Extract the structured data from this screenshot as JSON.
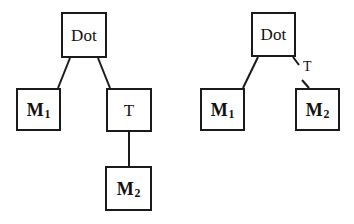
{
  "diagram": {
    "type": "tree-pair",
    "background_color": "#ffffff",
    "line_color": "#1a1a1a",
    "text_color": "#111111",
    "left_tree": {
      "name": "left-tree",
      "nodes": [
        {
          "id": "dot",
          "label": "Dot",
          "base": "Dot",
          "sub": "",
          "x": 61,
          "y": 12,
          "w": 46,
          "h": 46
        },
        {
          "id": "m1",
          "label": "M1",
          "base": "M",
          "sub": "1",
          "x": 16,
          "y": 88,
          "w": 45,
          "h": 43
        },
        {
          "id": "t",
          "label": "T",
          "base": "T",
          "sub": "",
          "x": 106,
          "y": 88,
          "w": 46,
          "h": 44
        },
        {
          "id": "m2",
          "label": "M2",
          "base": "M",
          "sub": "2",
          "x": 105,
          "y": 166,
          "w": 47,
          "h": 45
        }
      ],
      "edges": [
        {
          "from": "dot",
          "to": "m1",
          "label": "",
          "style": "solid"
        },
        {
          "from": "dot",
          "to": "t",
          "label": "",
          "style": "solid"
        },
        {
          "from": "t",
          "to": "m2",
          "label": "",
          "style": "solid"
        }
      ]
    },
    "right_tree": {
      "name": "right-tree",
      "nodes": [
        {
          "id": "dot",
          "label": "Dot",
          "base": "Dot",
          "sub": "",
          "x": 251,
          "y": 12,
          "w": 45,
          "h": 45
        },
        {
          "id": "m1",
          "label": "M1",
          "base": "M",
          "sub": "1",
          "x": 200,
          "y": 88,
          "w": 45,
          "h": 43
        },
        {
          "id": "m2",
          "label": "M2",
          "base": "M",
          "sub": "2",
          "x": 295,
          "y": 88,
          "w": 45,
          "h": 43
        }
      ],
      "edges": [
        {
          "from": "dot",
          "to": "m1",
          "label": "",
          "style": "solid"
        },
        {
          "from": "dot",
          "to": "m2",
          "label": "T",
          "style": "labeled-broken"
        }
      ],
      "edge_labels": [
        {
          "id": "t-edge-label",
          "text": "T",
          "x": 303,
          "y": 60
        }
      ]
    }
  }
}
